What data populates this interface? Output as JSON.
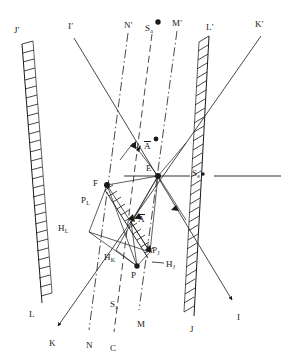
{
  "figure": {
    "type": "geometric-ray-diagram",
    "background_color": "#ffffff",
    "ink_color": "#1a1a1a",
    "width": 285,
    "height": 363
  },
  "labels": {
    "top": [
      {
        "id": "J-prime",
        "base": "J",
        "prime": true,
        "x": 14,
        "y": 26
      },
      {
        "id": "I-prime",
        "base": "I",
        "prime": true,
        "x": 68,
        "y": 22
      },
      {
        "id": "N-prime",
        "base": "N",
        "prime": true,
        "x": 124,
        "y": 21
      },
      {
        "id": "Sa-top",
        "base": "S",
        "sub": "a",
        "x": 146,
        "y": 24
      },
      {
        "id": "M-prime",
        "base": "M",
        "prime": true,
        "x": 172,
        "y": 19
      },
      {
        "id": "L-prime",
        "base": "L",
        "prime": true,
        "x": 206,
        "y": 23
      },
      {
        "id": "K-prime",
        "base": "K",
        "prime": true,
        "x": 255,
        "y": 20
      }
    ],
    "bottom": [
      {
        "id": "L-bottom",
        "base": "L",
        "x": 29,
        "y": 310
      },
      {
        "id": "K-bottom",
        "base": "K",
        "x": 49,
        "y": 339
      },
      {
        "id": "N-bottom",
        "base": "N",
        "x": 86,
        "y": 341
      },
      {
        "id": "C-bottom",
        "base": "C",
        "x": 110,
        "y": 344
      },
      {
        "id": "Sa-bottom",
        "base": "S",
        "sub": "a",
        "x": 111,
        "y": 300
      },
      {
        "id": "M-bottom",
        "base": "M",
        "x": 137,
        "y": 320
      },
      {
        "id": "J-bottom",
        "base": "J",
        "x": 190,
        "y": 325
      },
      {
        "id": "I-bottom",
        "base": "I",
        "x": 237,
        "y": 313
      }
    ],
    "interior": [
      {
        "id": "A-bar-upper",
        "base": "A",
        "overbar": true,
        "x": 144,
        "y": 142
      },
      {
        "id": "E-node",
        "base": "E",
        "x": 147,
        "y": 165
      },
      {
        "id": "Se-node",
        "base": "S",
        "sub": "e",
        "x": 193,
        "y": 170
      },
      {
        "id": "F-node",
        "base": "F",
        "x": 93,
        "y": 186
      },
      {
        "id": "P-L",
        "base": "P",
        "sub": "L",
        "x": 83,
        "y": 199
      },
      {
        "id": "A-bar-lower",
        "base": "A",
        "overbar": true,
        "x": 139,
        "y": 216
      },
      {
        "id": "H-L",
        "base": "H",
        "sub": "L",
        "x": 60,
        "y": 226
      },
      {
        "id": "H-K",
        "base": "H",
        "sub": "K",
        "x": 105,
        "y": 255
      },
      {
        "id": "P-J",
        "base": "P",
        "sub": "J",
        "x": 152,
        "y": 249
      },
      {
        "id": "H-J",
        "base": "H",
        "sub": "J",
        "x": 163,
        "y": 262
      },
      {
        "id": "P-node",
        "base": "P",
        "x": 131,
        "y": 272
      }
    ]
  },
  "markers": {
    "dots": [
      {
        "id": "dot-Sa-top",
        "x": 158,
        "y": 22,
        "r": 2.6
      },
      {
        "id": "dot-A-upper",
        "x": 156,
        "y": 139,
        "r": 2.4
      },
      {
        "id": "dot-E",
        "x": 158,
        "y": 176,
        "r": 2.9
      },
      {
        "id": "dot-F",
        "x": 107,
        "y": 185,
        "r": 2.9
      },
      {
        "id": "dot-P",
        "x": 137,
        "y": 266,
        "r": 2.6
      },
      {
        "id": "dot-Se",
        "x": 203,
        "y": 173,
        "r": 1.6
      }
    ]
  },
  "lines": {
    "hatched_bands": [
      {
        "id": "band-J-prime-to-L",
        "from": "J'",
        "to": "L",
        "x1": 22,
        "y1": 44,
        "x2": 42,
        "y2": 303,
        "hatch_side": "right"
      },
      {
        "id": "band-L-prime-to-J",
        "from": "L'",
        "to": "J",
        "x1": 209,
        "y1": 36,
        "x2": 194,
        "y2": 316,
        "hatch_side": "left"
      }
    ],
    "solid_rays": [
      {
        "id": "ray-I-prime-to-I",
        "from": "I'",
        "to": "I",
        "x1": 74,
        "y1": 38,
        "x2": 235,
        "y2": 305,
        "arrow": "end"
      },
      {
        "id": "ray-K-prime-to-K",
        "from": "K'",
        "to": "K",
        "x1": 262,
        "y1": 36,
        "x2": 56,
        "y2": 330,
        "arrow": "end"
      },
      {
        "id": "ray-Se-horizontal",
        "from": "E",
        "to": "S_e",
        "x1": 128,
        "y1": 176,
        "x2": 280,
        "y2": 176,
        "arrow": "none"
      }
    ],
    "dashdot_rays": [
      {
        "id": "ray-N-prime-to-N",
        "from": "N'",
        "to": "N",
        "x1": 128,
        "y1": 34,
        "x2": 90,
        "y2": 332
      },
      {
        "id": "ray-M-prime-to-M",
        "from": "M'",
        "to": "M",
        "x1": 177,
        "y1": 32,
        "x2": 140,
        "y2": 312
      }
    ],
    "dashed_rays": [
      {
        "id": "ray-Sa-top-to-C",
        "from": "S_a",
        "to": "C",
        "x1": 152,
        "y1": 34,
        "x2": 114,
        "y2": 334
      },
      {
        "id": "ray-L-prime-dashed",
        "from": "K'",
        "to": "L-lower",
        "x1": 258,
        "y1": 38,
        "x2": 120,
        "y2": 268
      }
    ]
  },
  "description": {
    "caption": "",
    "notes": "Ray construction diagram with two hatched reflector bands, solid and dash-dot ray paths, and labelled intersection nodes."
  }
}
